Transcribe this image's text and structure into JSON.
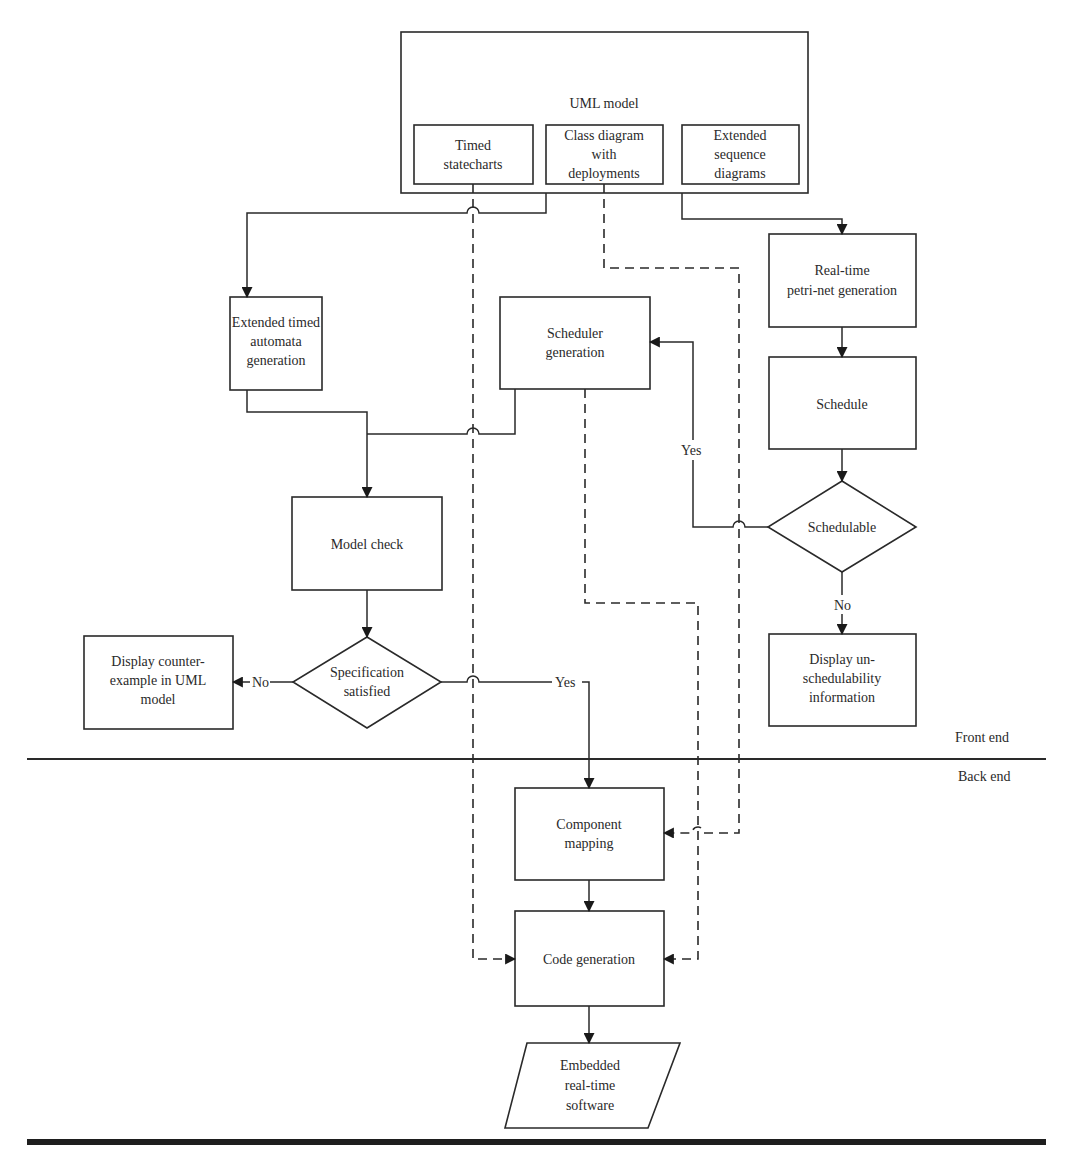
{
  "diagram": {
    "type": "flowchart",
    "colors": {
      "stroke": "#2a2a2a",
      "background": "#ffffff"
    },
    "uml_model": {
      "title": "UML model",
      "timed_statecharts": [
        "Timed",
        "statecharts"
      ],
      "class_diagram": [
        "Class diagram",
        "with",
        "deployments"
      ],
      "sequence_diagrams": [
        "Extended",
        "sequence",
        "diagrams"
      ]
    },
    "nodes": {
      "timed_automata": [
        "Extended timed",
        "automata",
        "generation"
      ],
      "scheduler_generation": [
        "Scheduler",
        "generation"
      ],
      "petri_net": [
        "Real-time",
        "petri-net generation"
      ],
      "schedule": "Schedule",
      "schedulable": "Schedulable",
      "display_unschedulability": [
        "Display un-",
        "schedulability",
        "information"
      ],
      "model_check": "Model check",
      "specification_satisfied": [
        "Specification",
        "satisfied"
      ],
      "display_counterexample": [
        "Display counter-",
        "example in UML",
        "model"
      ],
      "component_mapping": [
        "Component",
        "mapping"
      ],
      "code_generation": "Code generation",
      "embedded_software": [
        "Embedded",
        "real-time",
        "software"
      ]
    },
    "edge_labels": {
      "schedulable_yes": "Yes",
      "schedulable_no": "No",
      "spec_yes": "Yes",
      "spec_no": "No"
    },
    "sections": {
      "front_end": "Front end",
      "back_end": "Back end"
    }
  }
}
